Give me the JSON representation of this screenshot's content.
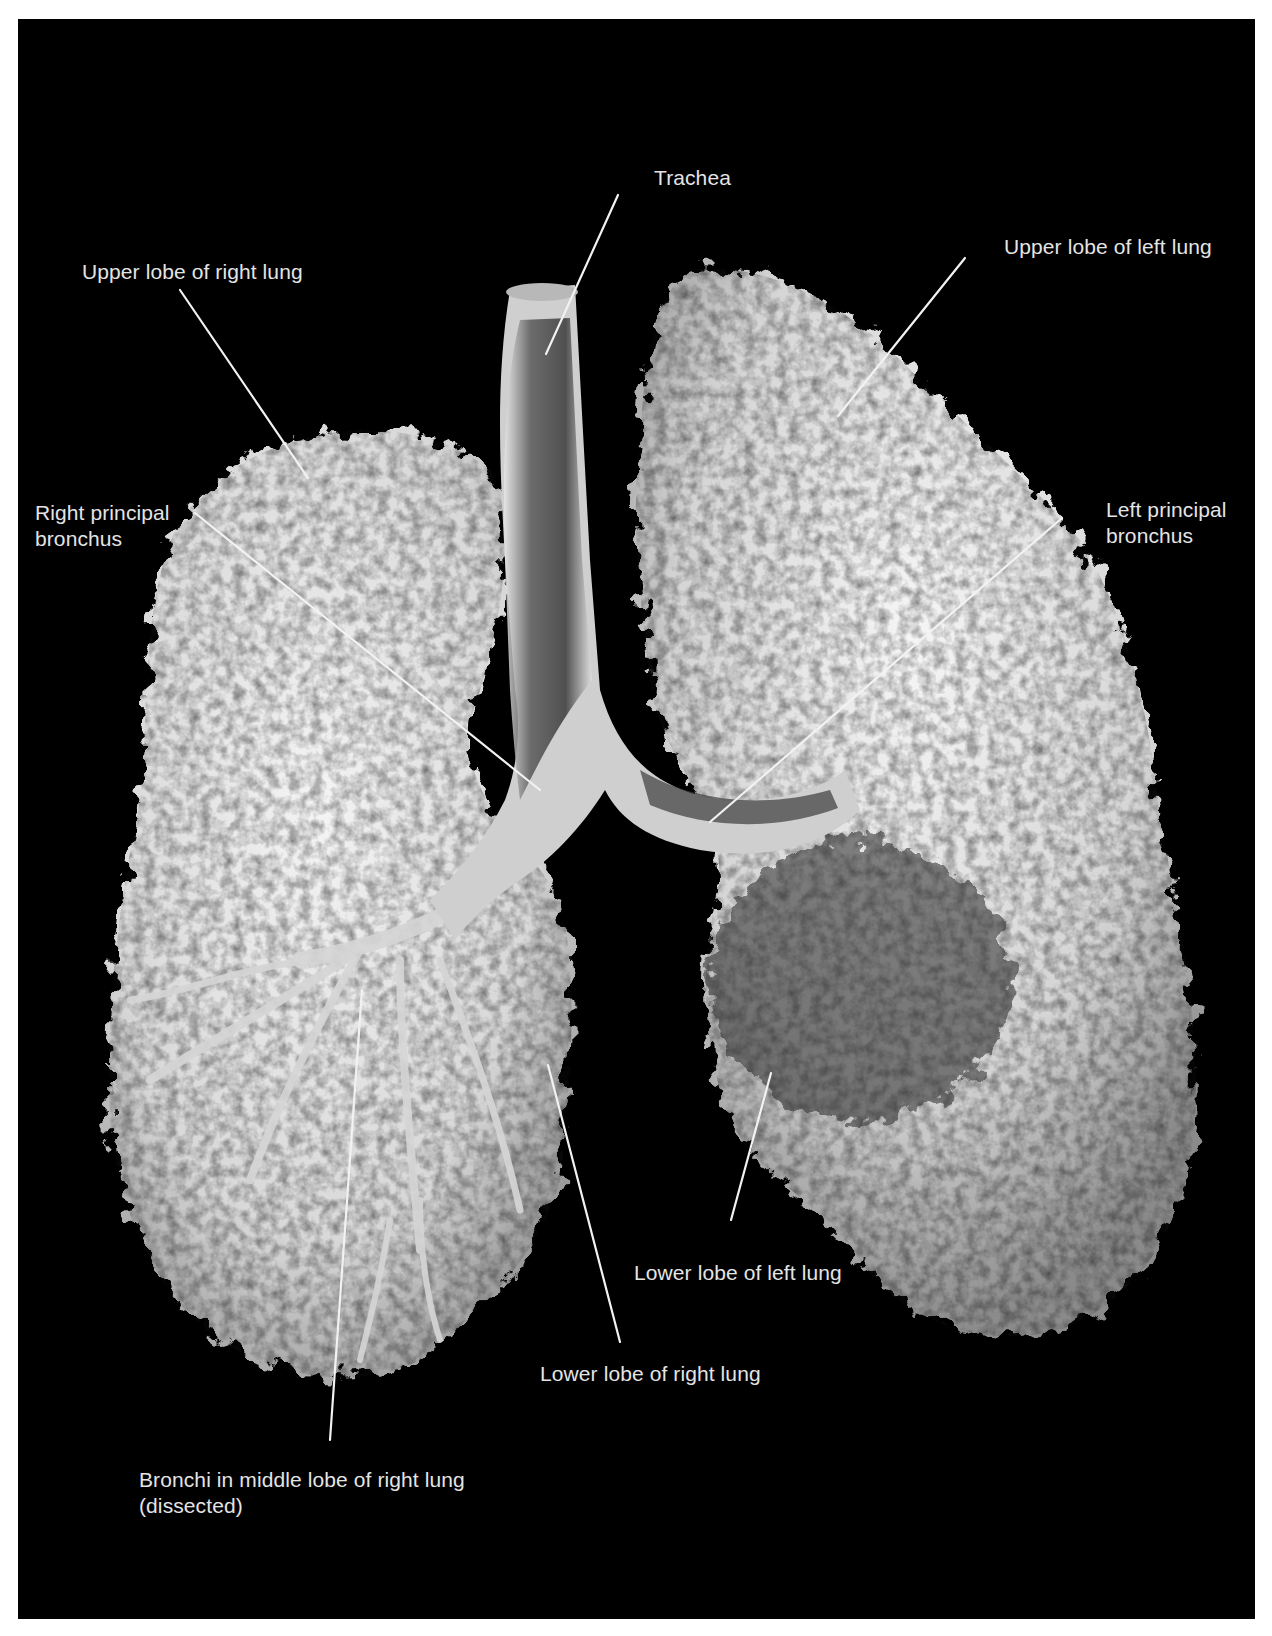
{
  "figure": {
    "background_color": "#000000",
    "margin_color": "#ffffff",
    "label_color": "#e4e4e4",
    "leader_line_color": "#f2f2f2"
  },
  "labels": {
    "trachea": {
      "lines": [
        "Trachea"
      ]
    },
    "upper_lobe_right": {
      "lines": [
        "Upper lobe of right lung"
      ]
    },
    "upper_lobe_left": {
      "lines": [
        "Upper lobe of left lung"
      ]
    },
    "right_principal_bronchus": {
      "lines": [
        "Right principal",
        "bronchus"
      ]
    },
    "left_principal_bronchus": {
      "lines": [
        "Left principal",
        "bronchus"
      ]
    },
    "lower_lobe_left": {
      "lines": [
        "Lower lobe of left lung"
      ]
    },
    "lower_lobe_right": {
      "lines": [
        "Lower lobe of right lung"
      ]
    },
    "middle_lobe_bronchi": {
      "lines": [
        "Bronchi in middle lobe of right lung",
        "(dissected)"
      ]
    }
  }
}
